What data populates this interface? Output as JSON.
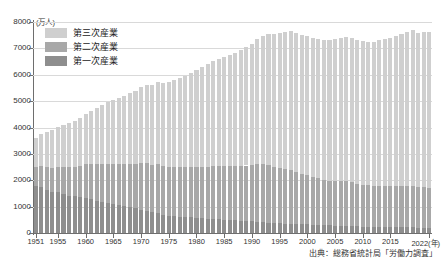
{
  "chart_data": {
    "type": "bar",
    "subtype": "stacked-bar",
    "title": "",
    "unit_label": "(万人)",
    "xlabel": "(年)",
    "ylabel": "",
    "ylim": [
      0,
      8000
    ],
    "ytick_step": 1000,
    "grid": true,
    "legend_position": "top-left",
    "source_note": "出典：総務省統計局「労働力調査」",
    "x_axis_end_label": "2022(年)",
    "yticks": [
      "0",
      "1000",
      "2000",
      "3000",
      "4000",
      "5000",
      "6000",
      "7000",
      "8000"
    ],
    "xticks": [
      "1951",
      "1955",
      "1960",
      "1965",
      "1970",
      "1975",
      "1980",
      "1985",
      "1990",
      "1995",
      "2000",
      "2005",
      "2010",
      "2015",
      "2022"
    ],
    "colors": {
      "primary": "#8e8e8e",
      "secondary": "#a8a8a8",
      "tertiary": "#cfcfcf",
      "gridline": "#d9d9d9",
      "axis": "#6e6e6e",
      "background": "#ffffff"
    },
    "categories": [
      1951,
      1952,
      1953,
      1954,
      1955,
      1956,
      1957,
      1958,
      1959,
      1960,
      1961,
      1962,
      1963,
      1964,
      1965,
      1966,
      1967,
      1968,
      1969,
      1970,
      1971,
      1972,
      1973,
      1974,
      1975,
      1976,
      1977,
      1978,
      1979,
      1980,
      1981,
      1982,
      1983,
      1984,
      1985,
      1986,
      1987,
      1988,
      1989,
      1990,
      1991,
      1992,
      1993,
      1994,
      1995,
      1996,
      1997,
      1998,
      1999,
      2000,
      2001,
      2002,
      2003,
      2004,
      2005,
      2006,
      2007,
      2008,
      2009,
      2010,
      2011,
      2012,
      2013,
      2014,
      2015,
      2016,
      2017,
      2018,
      2019,
      2020,
      2021,
      2022
    ],
    "series": [
      {
        "name": "第一次産業",
        "key": "primary",
        "values": [
          1780,
          1740,
          1620,
          1560,
          1540,
          1470,
          1420,
          1390,
          1350,
          1330,
          1280,
          1220,
          1170,
          1130,
          1110,
          1060,
          1010,
          970,
          930,
          890,
          840,
          790,
          740,
          690,
          660,
          640,
          620,
          610,
          590,
          580,
          560,
          550,
          540,
          530,
          510,
          500,
          490,
          470,
          450,
          440,
          420,
          400,
          390,
          380,
          370,
          360,
          350,
          340,
          330,
          330,
          320,
          310,
          300,
          290,
          280,
          270,
          260,
          250,
          250,
          240,
          230,
          230,
          230,
          220,
          220,
          220,
          210,
          210,
          210,
          200,
          200,
          190
        ]
      },
      {
        "name": "第二次産業",
        "key": "secondary",
        "values": [
          730,
          790,
          880,
          920,
          970,
          1030,
          1090,
          1120,
          1180,
          1270,
          1340,
          1400,
          1450,
          1500,
          1510,
          1550,
          1590,
          1650,
          1700,
          1780,
          1810,
          1800,
          1870,
          1850,
          1830,
          1850,
          1870,
          1880,
          1900,
          1930,
          1960,
          1970,
          1990,
          2010,
          2030,
          2040,
          2040,
          2070,
          2110,
          2130,
          2180,
          2210,
          2180,
          2130,
          2080,
          2060,
          2030,
          1980,
          1920,
          1870,
          1810,
          1760,
          1720,
          1700,
          1700,
          1690,
          1700,
          1680,
          1620,
          1580,
          1580,
          1570,
          1560,
          1560,
          1550,
          1560,
          1570,
          1580,
          1580,
          1550,
          1530,
          1530
        ]
      },
      {
        "name": "第三次産業",
        "key": "tertiary",
        "values": [
          1100,
          1220,
          1330,
          1430,
          1500,
          1600,
          1680,
          1750,
          1830,
          1910,
          2020,
          2120,
          2230,
          2330,
          2410,
          2510,
          2600,
          2680,
          2770,
          2870,
          2950,
          3020,
          3100,
          3150,
          3220,
          3300,
          3390,
          3480,
          3580,
          3680,
          3770,
          3870,
          3980,
          4050,
          4130,
          4220,
          4310,
          4400,
          4490,
          4600,
          4740,
          4850,
          4960,
          5050,
          5130,
          5200,
          5280,
          5260,
          5270,
          5270,
          5280,
          5280,
          5310,
          5340,
          5390,
          5440,
          5480,
          5470,
          5440,
          5450,
          5440,
          5450,
          5510,
          5570,
          5620,
          5690,
          5750,
          5830,
          5900,
          5850,
          5890,
          5920
        ]
      }
    ],
    "totals": [
      3610,
      3750,
      3830,
      3910,
      4010,
      4100,
      4190,
      4260,
      4360,
      4510,
      4640,
      4740,
      4850,
      4960,
      5030,
      5120,
      5200,
      5300,
      5400,
      5540,
      5600,
      5610,
      5710,
      5690,
      5710,
      5790,
      5880,
      5970,
      6070,
      6190,
      6290,
      6390,
      6510,
      6590,
      6670,
      6760,
      6840,
      6940,
      7050,
      7170,
      7340,
      7460,
      7530,
      7560,
      7580,
      7620,
      7660,
      7580,
      7520,
      7470,
      7410,
      7350,
      7330,
      7330,
      7370,
      7400,
      7440,
      7400,
      7310,
      7270,
      7250,
      7250,
      7300,
      7350,
      7390,
      7470,
      7530,
      7620,
      7690,
      7600,
      7620,
      7640
    ],
    "notes": {
      "peak_year": 1997,
      "peak_total": 6650,
      "description": "日本の産業別就業者数の推移（1951年〜2022年）"
    }
  },
  "legend": {
    "items": [
      {
        "label": "第三次産業",
        "key": "tertiary"
      },
      {
        "label": "第二次産業",
        "key": "secondary"
      },
      {
        "label": "第一次産業",
        "key": "primary"
      }
    ]
  }
}
